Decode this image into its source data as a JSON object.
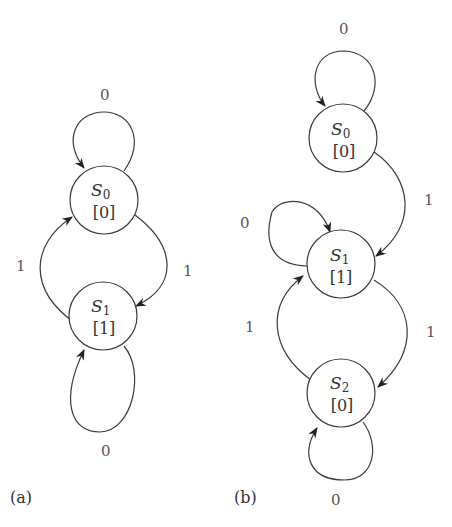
{
  "diagram_a": {
    "caption": "(a)",
    "states": [
      {
        "id": "S0",
        "name": "S",
        "subscript": "0",
        "output": "[0]"
      },
      {
        "id": "S1",
        "name": "S",
        "subscript": "1",
        "output": "[1]"
      }
    ],
    "transitions": [
      {
        "from": "S0",
        "to": "S0",
        "label": "0"
      },
      {
        "from": "S0",
        "to": "S1",
        "label": "1"
      },
      {
        "from": "S1",
        "to": "S0",
        "label": "1"
      },
      {
        "from": "S1",
        "to": "S1",
        "label": "0"
      }
    ]
  },
  "diagram_b": {
    "caption": "(b)",
    "states": [
      {
        "id": "S0",
        "name": "S",
        "subscript": "0",
        "output": "[0]"
      },
      {
        "id": "S1",
        "name": "S",
        "subscript": "1",
        "output": "[1]"
      },
      {
        "id": "S2",
        "name": "S",
        "subscript": "2",
        "output": "[0]"
      }
    ],
    "transitions": [
      {
        "from": "S0",
        "to": "S0",
        "label": "0"
      },
      {
        "from": "S0",
        "to": "S1",
        "label": "1"
      },
      {
        "from": "S1",
        "to": "S1",
        "label": "0"
      },
      {
        "from": "S1",
        "to": "S2",
        "label": "1"
      },
      {
        "from": "S2",
        "to": "S1",
        "label": "1"
      },
      {
        "from": "S2",
        "to": "S2",
        "label": "0"
      }
    ]
  }
}
